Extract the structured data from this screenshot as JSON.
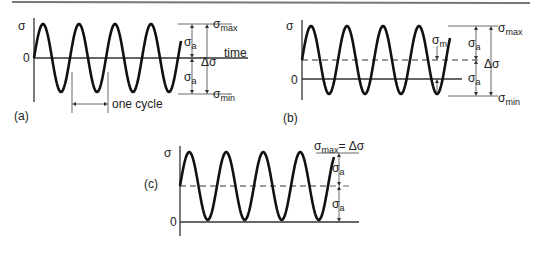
{
  "figure": {
    "panels": [
      {
        "id": "a",
        "label": "(a)",
        "y_axis_label": "σ",
        "zero_label": "0",
        "time_label": "time",
        "cycle_label": "one cycle",
        "sigma_max": "max",
        "sigma_min": "min",
        "sigma_a": "a",
        "delta_sigma": "Δσ",
        "cycles": 4,
        "mean_stress": 0
      },
      {
        "id": "b",
        "label": "(b)",
        "y_axis_label": "σ",
        "zero_label": "0",
        "sigma_m": "m",
        "sigma_max": "max",
        "sigma_min": "min",
        "sigma_a": "a",
        "delta_sigma": "Δσ",
        "cycles": 4
      },
      {
        "id": "c",
        "label": "(c)",
        "y_axis_label": "σ",
        "zero_label": "0",
        "sigma_max_eq": "= Δσ",
        "sigma_max": "max",
        "sigma_a": "a",
        "cycles": 4
      }
    ],
    "symbol_sigma": "σ"
  }
}
